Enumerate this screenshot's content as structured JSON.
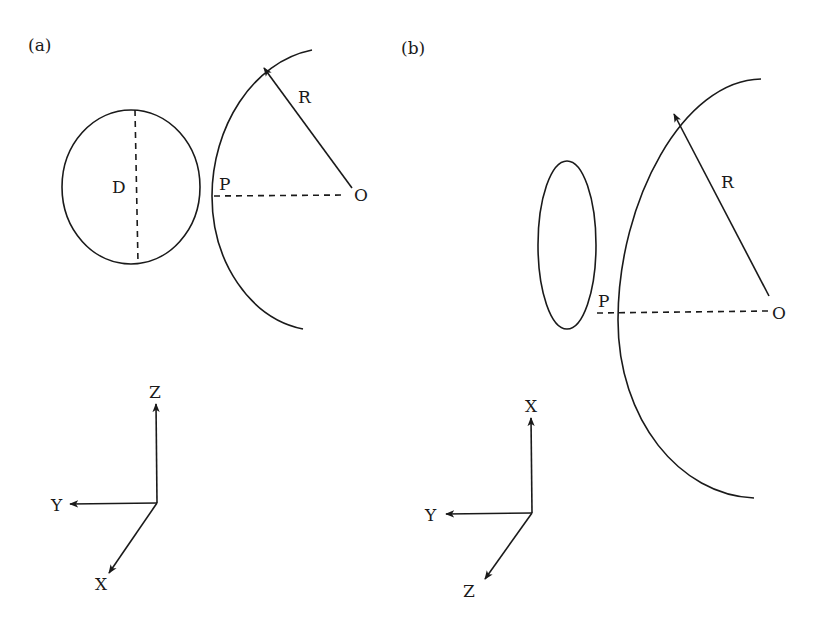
{
  "figure": {
    "panel_a": {
      "label": "(a)",
      "diameter_label": "D",
      "contact_point_label": "P",
      "radius_label": "R",
      "center_label": "O",
      "axes": {
        "up": "Z",
        "left": "Y",
        "down_left": "X"
      }
    },
    "panel_b": {
      "label": "(b)",
      "contact_point_label": "P",
      "radius_label": "R",
      "center_label": "O",
      "axes": {
        "up": "X",
        "left": "Y",
        "down_left": "Z"
      }
    },
    "colors": {
      "line": "#1a1a1a",
      "background": "#ffffff"
    }
  }
}
